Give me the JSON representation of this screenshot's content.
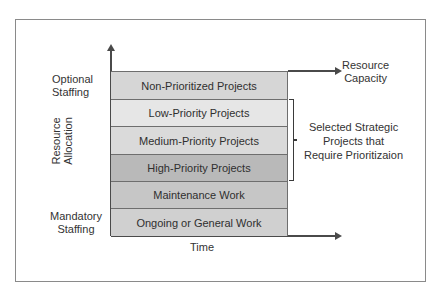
{
  "diagram": {
    "title": "",
    "y_axis_label": [
      "Resource",
      "Allocation"
    ],
    "x_axis_label": "Time",
    "capacity_label": [
      "Resource",
      "Capacity"
    ],
    "optional_label": [
      "Optional",
      "Staffing"
    ],
    "mandatory_label": [
      "Mandatory",
      "Staffing"
    ],
    "bracket_label": [
      "Selected Strategic",
      "Projects that",
      "Require Prioritizaion"
    ],
    "bands": [
      {
        "label": "Non-Prioritized Projects",
        "color": "#d6d6d6"
      },
      {
        "label": "Low-Priority Projects",
        "color": "#e6e6e6"
      },
      {
        "label": "Medium-Priority Projects",
        "color": "#d9d9d9"
      },
      {
        "label": "High-Priority Projects",
        "color": "#b8b8b8"
      },
      {
        "label": "Maintenance Work",
        "color": "#c4c4c4"
      },
      {
        "label": "Ongoing or General Work",
        "color": "#cfcfcf"
      }
    ],
    "colors": {
      "frame_border": "#8a8a8a",
      "axis": "#4a4a4a",
      "text": "#333333"
    }
  }
}
